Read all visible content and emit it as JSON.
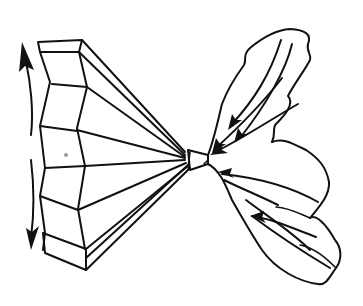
{
  "figure": {
    "description": "Line drawing of a faceted horn/funnel narrowing to a small nozzle, joined to a multi-lobed cloud shape with arrows converging toward the nozzle; vertical double arrow at left edge",
    "colors": {
      "ink": "#111111",
      "background": "#ffffff"
    },
    "elements": {
      "left": "faceted-horn",
      "center": "nozzle",
      "right": "lobed-cloud-with-inflow-arrows",
      "edge": "vertical-double-arrow"
    }
  }
}
